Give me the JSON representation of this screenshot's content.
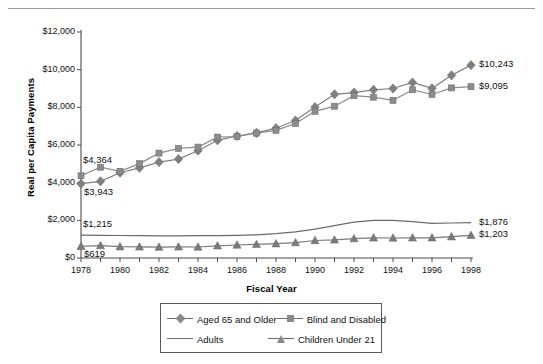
{
  "figure": {
    "top_rule": true,
    "ghost_text": ""
  },
  "chart_data": {
    "type": "line",
    "title": "",
    "xlabel": "Fiscal Year",
    "ylabel": "Real per Capita Payments",
    "x": [
      1978,
      1979,
      1980,
      1981,
      1982,
      1983,
      1984,
      1985,
      1986,
      1987,
      1988,
      1989,
      1990,
      1991,
      1992,
      1993,
      1994,
      1995,
      1996,
      1997,
      1998
    ],
    "xlim": [
      1978,
      1998
    ],
    "ylim": [
      0,
      12000
    ],
    "ytick_labels": [
      "$0",
      "$2,000",
      "$4,000",
      "$6,000",
      "$8,000",
      "$10,000",
      "$12,000"
    ],
    "ytick_values": [
      0,
      2000,
      4000,
      6000,
      8000,
      10000,
      12000
    ],
    "xtick_labels": [
      "1978",
      "1980",
      "1982",
      "1984",
      "1986",
      "1988",
      "1990",
      "1992",
      "1994",
      "1996",
      "1998"
    ],
    "xtick_values": [
      1978,
      1980,
      1982,
      1984,
      1986,
      1988,
      1990,
      1992,
      1994,
      1996,
      1998
    ],
    "grid": false,
    "legend_position": "bottom",
    "series": [
      {
        "name": "Aged 65 and Older",
        "marker": "diamond",
        "color": "#808080",
        "values": [
          3943,
          4070,
          4530,
          4790,
          5090,
          5250,
          5700,
          6250,
          6480,
          6640,
          6890,
          7300,
          8010,
          8690,
          8780,
          8930,
          9000,
          9320,
          9010,
          9700,
          10243
        ]
      },
      {
        "name": "Blind and Disabled",
        "marker": "square",
        "color": "#8c8c8c",
        "values": [
          4364,
          4820,
          4600,
          5010,
          5570,
          5820,
          5890,
          6420,
          6450,
          6630,
          6780,
          7140,
          7790,
          8060,
          8620,
          8540,
          8370,
          8930,
          8680,
          9030,
          9095
        ]
      },
      {
        "name": "Adults",
        "marker": "none",
        "color": "#6b6b6b",
        "values": [
          1215,
          1205,
          1195,
          1185,
          1180,
          1180,
          1185,
          1190,
          1200,
          1230,
          1290,
          1390,
          1530,
          1720,
          1900,
          2000,
          1995,
          1930,
          1840,
          1860,
          1876
        ]
      },
      {
        "name": "Children Under 21",
        "marker": "triangle",
        "color": "#7a7a7a",
        "values": [
          619,
          660,
          600,
          590,
          580,
          590,
          585,
          650,
          690,
          720,
          760,
          820,
          930,
          960,
          1030,
          1070,
          1060,
          1070,
          1070,
          1130,
          1203
        ]
      }
    ],
    "annotations": [
      {
        "text": "$4,364",
        "series": "Blind and Disabled",
        "at_year": 1978,
        "placement": "above-left"
      },
      {
        "text": "$3,943",
        "series": "Aged 65 and Older",
        "at_year": 1978,
        "placement": "below-right"
      },
      {
        "text": "$1,215",
        "series": "Adults",
        "at_year": 1978,
        "placement": "above-right"
      },
      {
        "text": "$619",
        "series": "Children Under 21",
        "at_year": 1978,
        "placement": "below-right"
      },
      {
        "text": "$10,243",
        "series": "Aged 65 and Older",
        "at_year": 1998,
        "placement": "right"
      },
      {
        "text": "$9,095",
        "series": "Blind and Disabled",
        "at_year": 1998,
        "placement": "right"
      },
      {
        "text": "$1,876",
        "series": "Adults",
        "at_year": 1998,
        "placement": "right"
      },
      {
        "text": "$1,203",
        "series": "Children Under 21",
        "at_year": 1998,
        "placement": "right"
      }
    ]
  },
  "legend": {
    "entries": [
      {
        "label": "Aged 65 and Older",
        "marker": "diamond"
      },
      {
        "label": "Blind and Disabled",
        "marker": "square"
      },
      {
        "label": "Adults",
        "marker": "none"
      },
      {
        "label": "Children Under 21",
        "marker": "triangle"
      }
    ]
  }
}
